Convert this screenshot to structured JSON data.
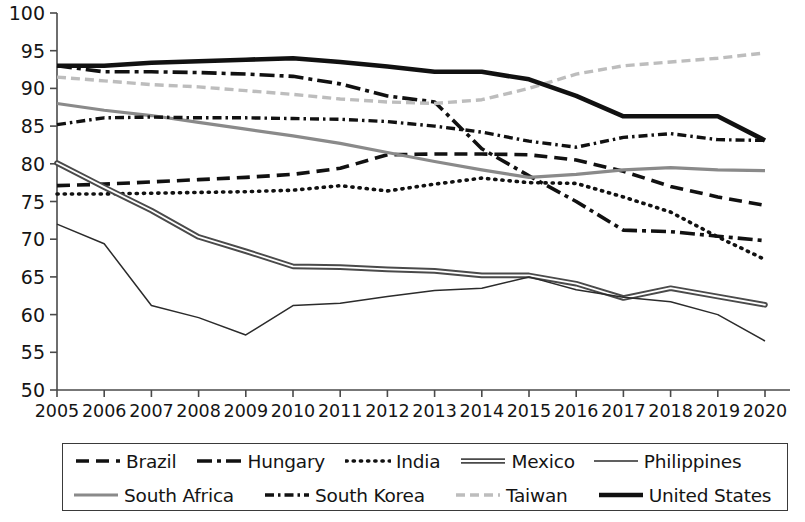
{
  "chart_data": {
    "type": "line",
    "title": "",
    "xlabel": "",
    "ylabel": "",
    "x": [
      2005,
      2006,
      2007,
      2008,
      2009,
      2010,
      2011,
      2012,
      2013,
      2014,
      2015,
      2016,
      2017,
      2018,
      2019,
      2020
    ],
    "xtick_labels": [
      "2005",
      "2006",
      "2007",
      "2008",
      "2009",
      "2010",
      "2011",
      "2012",
      "2013",
      "2014",
      "2015",
      "2016",
      "2017",
      "2018",
      "2019",
      "2020"
    ],
    "ytick_labels": [
      "50",
      "55",
      "60",
      "65",
      "70",
      "75",
      "80",
      "85",
      "90",
      "95",
      "100"
    ],
    "yticks": [
      50,
      55,
      60,
      65,
      70,
      75,
      80,
      85,
      90,
      95,
      100
    ],
    "ylim": [
      50,
      100
    ],
    "xlim": [
      2005,
      2020
    ],
    "grid": false,
    "legend_position": "bottom",
    "series": [
      {
        "name": "Brazil",
        "style": "dashed",
        "color": "#111111",
        "width": 3.6,
        "dash": "13,7",
        "values": [
          77.1,
          77.3,
          77.6,
          77.9,
          78.2,
          78.6,
          79.4,
          81.2,
          81.3,
          81.3,
          81.2,
          80.5,
          79.0,
          77.0,
          75.6,
          74.5
        ]
      },
      {
        "name": "Hungary",
        "style": "dash-dot",
        "color": "#111111",
        "width": 3.6,
        "dash": "15,5,4,5",
        "values": [
          93.0,
          92.2,
          92.2,
          92.1,
          91.9,
          91.6,
          90.6,
          89.0,
          88.2,
          82.0,
          78.4,
          75.0,
          71.2,
          71.0,
          70.4,
          69.8
        ]
      },
      {
        "name": "India",
        "style": "dotted",
        "color": "#111111",
        "width": 3.6,
        "dash": "1.2,6",
        "values": [
          76.0,
          76.0,
          76.1,
          76.2,
          76.3,
          76.5,
          77.1,
          76.4,
          77.3,
          78.1,
          77.5,
          77.4,
          75.6,
          73.6,
          70.3,
          67.3
        ]
      },
      {
        "name": "Mexico",
        "style": "double",
        "color": "#3d3d3d",
        "width": 3.0,
        "dash": "",
        "values": [
          80.1,
          76.9,
          73.8,
          70.3,
          68.4,
          66.4,
          66.3,
          66.0,
          65.8,
          65.2,
          65.2,
          64.1,
          62.2,
          63.5,
          62.4,
          61.3
        ]
      },
      {
        "name": "Philippines",
        "style": "thin-solid",
        "color": "#2b2b2b",
        "width": 1.5,
        "dash": "",
        "values": [
          72.0,
          69.4,
          61.2,
          59.6,
          57.3,
          61.2,
          61.5,
          62.4,
          63.2,
          63.5,
          65.0,
          63.3,
          62.3,
          61.7,
          60.0,
          56.5
        ]
      },
      {
        "name": "South Africa",
        "style": "solid-gray",
        "color": "#8a8a8a",
        "width": 3.2,
        "dash": "",
        "values": [
          88.0,
          87.1,
          86.4,
          85.5,
          84.6,
          83.7,
          82.7,
          81.5,
          80.3,
          79.2,
          78.2,
          78.6,
          79.2,
          79.5,
          79.2,
          79.1
        ]
      },
      {
        "name": "South Korea",
        "style": "dash-dot-dot",
        "color": "#111111",
        "width": 3.4,
        "dash": "9,4,2.5,4",
        "values": [
          85.2,
          86.1,
          86.2,
          86.1,
          86.1,
          86.0,
          85.9,
          85.6,
          85.0,
          84.2,
          83.0,
          82.2,
          83.5,
          84.0,
          83.2,
          83.1
        ]
      },
      {
        "name": "Taiwan",
        "style": "dashed-light",
        "color": "#bdbdbd",
        "width": 3.4,
        "dash": "9,5",
        "values": [
          91.5,
          91.0,
          90.5,
          90.2,
          89.7,
          89.2,
          88.6,
          88.2,
          88.0,
          88.5,
          90.0,
          91.9,
          93.0,
          93.5,
          94.0,
          94.7
        ]
      },
      {
        "name": "United States",
        "style": "thick-solid",
        "color": "#111111",
        "width": 4.6,
        "dash": "",
        "values": [
          93.0,
          93.0,
          93.4,
          93.6,
          93.8,
          94.0,
          93.5,
          92.9,
          92.2,
          92.2,
          91.2,
          89.0,
          86.3,
          86.3,
          86.3,
          83.1
        ]
      }
    ]
  },
  "legend": {
    "rows": [
      [
        {
          "label": "Brazil",
          "series": "Brazil"
        },
        {
          "label": "Hungary",
          "series": "Hungary"
        },
        {
          "label": "India",
          "series": "India"
        },
        {
          "label": "Mexico",
          "series": "Mexico"
        },
        {
          "label": "Philippines",
          "series": "Philippines"
        }
      ],
      [
        {
          "label": "South Africa",
          "series": "South Africa"
        },
        {
          "label": "South Korea",
          "series": "South Korea"
        },
        {
          "label": "Taiwan",
          "series": "Taiwan"
        },
        {
          "label": "United States",
          "series": "United States"
        }
      ]
    ]
  },
  "axis": {
    "axis_color": "#4a4a4a"
  }
}
